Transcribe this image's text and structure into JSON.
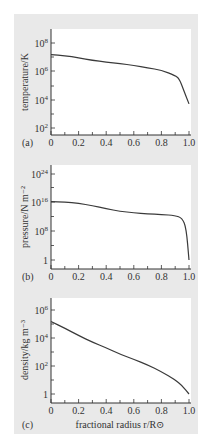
{
  "figure": {
    "panels": [
      {
        "letter": "(a)",
        "ylabel": "temperature/K"
      },
      {
        "letter": "(b)",
        "ylabel": "pressure/N m⁻²"
      },
      {
        "letter": "(c)",
        "ylabel": "density/kg m⁻³"
      }
    ],
    "xlabel": "fractional radius r/R⊙",
    "colors": {
      "background": "#e9e9e9",
      "plot_area": "#ffffff",
      "curve": "#3a3a3a"
    }
  },
  "chart_data": [
    {
      "type": "line",
      "title": "(a)",
      "xlabel": "",
      "ylabel": "temperature/K",
      "yscale": "log",
      "xlim": [
        0,
        1.0
      ],
      "ylim": [
        10,
        1000000000.0
      ],
      "x_ticks": [
        "0",
        "0.2",
        "0.4",
        "0.6",
        "0.8",
        "1.0"
      ],
      "y_ticks": [
        "10^2",
        "10^4",
        "10^6",
        "10^8"
      ],
      "x": [
        0,
        0.1,
        0.2,
        0.3,
        0.4,
        0.5,
        0.6,
        0.7,
        0.8,
        0.9,
        0.93,
        0.96,
        1.0
      ],
      "values": [
        15000000.0,
        13000000.0,
        9000000.0,
        6000000.0,
        4500000.0,
        3500000.0,
        2600000.0,
        1800000.0,
        1200000.0,
        500000.0,
        300000.0,
        50000.0,
        5000.0
      ]
    },
    {
      "type": "line",
      "title": "(b)",
      "xlabel": "",
      "ylabel": "pressure/N m^-2",
      "yscale": "log",
      "xlim": [
        0,
        1.0
      ],
      "ylim": [
        0.1,
        1e+28
      ],
      "x_ticks": [
        "0",
        "0.2",
        "0.4",
        "0.6",
        "0.8",
        "1.0"
      ],
      "y_ticks": [
        "1",
        "10^8",
        "10^16",
        "10^24"
      ],
      "x": [
        0,
        0.1,
        0.2,
        0.3,
        0.4,
        0.5,
        0.6,
        0.7,
        0.8,
        0.9,
        0.95,
        0.98,
        1.0
      ],
      "values": [
        2e+16,
        1.5e+16,
        6000000000000000.0,
        1500000000000000.0,
        200000000000000.0,
        40000000000000.0,
        15000000000000.0,
        8000000000000.0,
        5000000000000.0,
        2500000000000.0,
        500000000000.0,
        1000000000.0,
        1
      ]
    },
    {
      "type": "line",
      "title": "(c)",
      "xlabel": "fractional radius r/R⊙",
      "ylabel": "density/kg m^-3",
      "yscale": "log",
      "xlim": [
        0,
        1.0
      ],
      "ylim": [
        0.3,
        10000000.0
      ],
      "x_ticks": [
        "0",
        "0.2",
        "0.4",
        "0.6",
        "0.8",
        "1.0"
      ],
      "y_ticks": [
        "1",
        "10^2",
        "10^4",
        "10^6"
      ],
      "x": [
        0,
        0.1,
        0.2,
        0.3,
        0.4,
        0.5,
        0.6,
        0.7,
        0.8,
        0.9,
        0.95,
        1.0
      ],
      "values": [
        150000.0,
        50000.0,
        15000.0,
        5000.0,
        2000.0,
        700.0,
        300.0,
        120.0,
        40,
        10,
        4,
        1
      ]
    }
  ]
}
